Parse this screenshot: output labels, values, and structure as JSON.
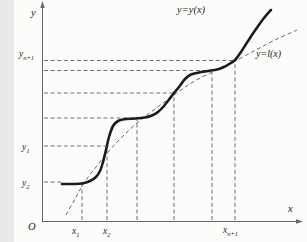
{
  "figure": {
    "colors": {
      "paper": "#fcfcfa",
      "ink": "#1c1c1c",
      "dash": "#555555",
      "axis": "#666666"
    },
    "width": 293,
    "height": 242
  },
  "labels": {
    "y_axis": "y",
    "x_axis": "x",
    "origin": "O",
    "curve_label": "y=y(x)",
    "line_label": "y=l(x)"
  },
  "chart_data": {
    "type": "line",
    "title": "",
    "xlabel": "x",
    "ylabel": "y",
    "grid": "dashed construction guides only",
    "legend": [
      "y=y(x)",
      "y=l(x)"
    ],
    "x_ticks": [
      {
        "base": "x",
        "sub": "1",
        "px": 68
      },
      {
        "base": "x",
        "sub": "2",
        "px": 93
      },
      {
        "base": "x",
        "sub": "n+1",
        "px": 221
      }
    ],
    "y_ticks": [
      {
        "base": "y",
        "sub": "n+1",
        "py": 60.5
      },
      {
        "base": "y",
        "sub": "1",
        "py": 146
      },
      {
        "base": "y",
        "sub": "2",
        "py": 182
      }
    ],
    "construction_points": [
      [
        68,
        182
      ],
      [
        93,
        146
      ],
      [
        123,
        118
      ],
      [
        160,
        93
      ],
      [
        198,
        70.5
      ],
      [
        221,
        60.5
      ]
    ],
    "curves": [
      {
        "name": "y=y(x)",
        "style": "solid-thick",
        "points": [
          [
            48,
            184
          ],
          [
            58,
            184
          ],
          [
            68,
            183.5
          ],
          [
            76,
            181
          ],
          [
            82,
            177
          ],
          [
            86,
            171
          ],
          [
            89,
            162
          ],
          [
            92,
            150
          ],
          [
            95,
            137
          ],
          [
            99,
            126
          ],
          [
            104,
            121
          ],
          [
            112,
            119
          ],
          [
            122,
            118.5
          ],
          [
            131,
            117.5
          ],
          [
            138,
            115.5
          ],
          [
            144,
            112
          ],
          [
            150,
            106
          ],
          [
            155,
            99.5
          ],
          [
            160,
            93
          ],
          [
            165,
            87
          ],
          [
            171,
            79
          ],
          [
            177,
            74.5
          ],
          [
            185,
            72.5
          ],
          [
            194,
            71
          ],
          [
            203,
            69.5
          ],
          [
            210,
            67
          ],
          [
            216,
            63.5
          ],
          [
            221,
            60
          ],
          [
            227,
            52
          ],
          [
            234,
            41
          ],
          [
            242,
            29
          ],
          [
            250,
            18
          ],
          [
            257,
            10
          ]
        ]
      },
      {
        "name": "y=l(x)",
        "style": "dashed-thin",
        "points": [
          [
            52,
            215
          ],
          [
            61,
            199
          ],
          [
            70,
            183
          ],
          [
            82,
            167
          ],
          [
            95,
            151
          ],
          [
            108,
            137
          ],
          [
            123,
            123
          ],
          [
            141,
            109
          ],
          [
            160,
            95
          ],
          [
            179,
            82
          ],
          [
            198,
            72
          ],
          [
            210,
            66
          ],
          [
            221,
            61
          ],
          [
            240,
            51
          ],
          [
            261,
            40
          ],
          [
            283,
            30
          ]
        ]
      }
    ],
    "h_guides": [
      {
        "y": 60.5,
        "x1": 30,
        "x2": 221
      },
      {
        "y": 70.5,
        "x1": 30,
        "x2": 198
      },
      {
        "y": 93,
        "x1": 30,
        "x2": 160
      },
      {
        "y": 118,
        "x1": 30,
        "x2": 123
      },
      {
        "y": 146,
        "x1": 30,
        "x2": 91
      },
      {
        "y": 182,
        "x1": 30,
        "x2": 48
      }
    ],
    "v_guides": [
      {
        "x": 68,
        "y1": 220,
        "y2": 184
      },
      {
        "x": 93,
        "y1": 220,
        "y2": 148
      },
      {
        "x": 123,
        "y1": 220,
        "y2": 120
      },
      {
        "x": 160,
        "y1": 220,
        "y2": 95
      },
      {
        "x": 198,
        "y1": 220,
        "y2": 72
      },
      {
        "x": 221,
        "y1": 220,
        "y2": 61
      }
    ],
    "axes": {
      "y_axis": {
        "x": 28.5,
        "y_top": 5,
        "y_bottom": 222
      },
      "x_axis": {
        "y": 221.5,
        "x_left": 28,
        "x_right": 285
      }
    }
  }
}
